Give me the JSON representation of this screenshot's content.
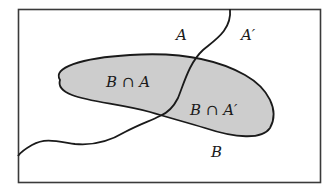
{
  "diagram": {
    "type": "venn-partition",
    "colors": {
      "background": "#ffffff",
      "frame": "#3a3a3a",
      "shaded_region": "#cdcdcd",
      "stroke": "#1a1a1a"
    },
    "labels": {
      "set_a": "A",
      "set_a_complement": "A′",
      "set_b": "B",
      "b_intersect_a": "B ∩ A",
      "b_intersect_a_complement": "B ∩ A′"
    }
  }
}
